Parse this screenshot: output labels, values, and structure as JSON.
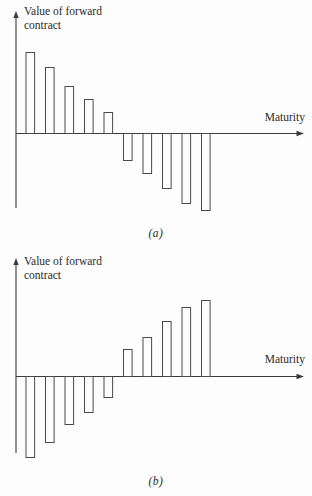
{
  "colors": {
    "background": "#fdfdfd",
    "axis_line": "#3d3d3d",
    "bar_outline": "#4a4a4a",
    "bar_fill": "#fdfdfd",
    "text": "#2b2b2b"
  },
  "panels": [
    {
      "id": "a",
      "y_axis_label": "Value of forward\ncontract",
      "x_axis_label": "Maturity",
      "caption": "(a)"
    },
    {
      "id": "b",
      "y_axis_label": "Value of forward\ncontract",
      "x_axis_label": "Maturity",
      "caption": "(b)"
    }
  ],
  "chart_data": [
    {
      "type": "bar",
      "panel": "a",
      "title": "",
      "xlabel": "Maturity",
      "ylabel": "Value of forward contract",
      "caption": "(a)",
      "categories": [
        1,
        2,
        3,
        4,
        5,
        6,
        7,
        8,
        9,
        10
      ],
      "values": [
        81,
        66,
        47,
        34,
        21,
        -27,
        -40,
        -55,
        -70,
        -77
      ],
      "value_units": "relative (no numeric scale shown on axes)",
      "ylim": [
        -90,
        90
      ],
      "grid": false,
      "legend": false,
      "bar_style": "hollow outline"
    },
    {
      "type": "bar",
      "panel": "b",
      "title": "",
      "xlabel": "Maturity",
      "ylabel": "Value of forward contract",
      "caption": "(b)",
      "categories": [
        1,
        2,
        3,
        4,
        5,
        6,
        7,
        8,
        9,
        10
      ],
      "values": [
        -81,
        -66,
        -48,
        -36,
        -21,
        27,
        39,
        55,
        69,
        76
      ],
      "value_units": "relative (no numeric scale shown on axes)",
      "ylim": [
        -90,
        90
      ],
      "grid": false,
      "legend": false,
      "bar_style": "hollow outline"
    }
  ]
}
